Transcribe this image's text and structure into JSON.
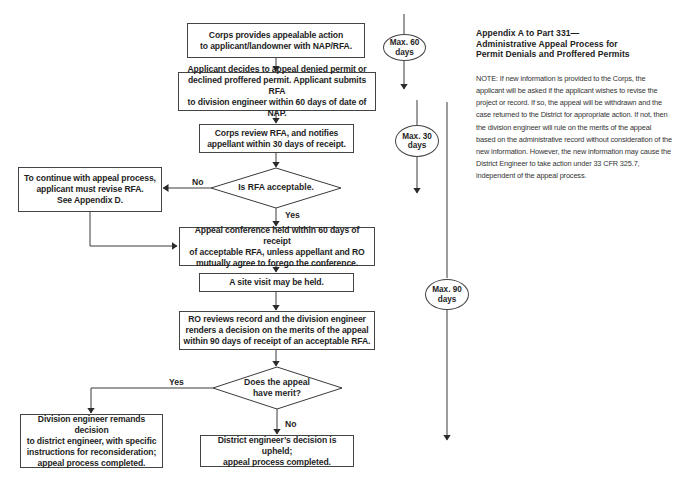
{
  "diagram": {
    "type": "flowchart",
    "title_lines": [
      "Appendix A to Part 331—",
      "Administrative Appeal Process for",
      "Permit Denials and Proffered Permits"
    ],
    "note": "NOTE: If new information is provided to the Corps, the applicant will be asked if the applicant wishes to revise the project or record. If so, the appeal will be withdrawn and the case returned to the District for appropriate action. If not, then the division engineer will rule on the merits of the appeal based on the administrative record without consideration of the new information. However, the new information may cause the District Engineer to take action under 33 CFR 325.7, independent of the appeal process.",
    "nodes": {
      "step1": "Corps provides appealable action\nto applicant/landowner with NAP/RFA.",
      "step2": "Applicant decides to appeal denied permit or\ndeclined proffered permit. Applicant submits RFA\nto division engineer within 60 days of date of NAP.",
      "step3": "Corps review RFA, and notifies\nappellant within 30 days of receipt.",
      "decision1": "Is RFA acceptable.",
      "revise": "To continue with appeal process,\napplicant must revise RFA.\nSee Appendix D.",
      "step4": "Appeal conference held within 60 days of receipt\nof acceptable RFA, unless appellant and RO\nmutually agree to forego the conference.",
      "step5": "A site visit may be held.",
      "step6": "RO reviews record and the division engineer\nrenders a decision on the merits of the appeal\nwithin 90 days of receipt of an acceptable RFA.",
      "decision2": "Does the appeal\nhave merit?",
      "remand": "Division engineer remands decision\nto district engineer, with specific\ninstructions for reconsideration;\nappeal process completed.",
      "upheld": "District engineer’s decision is upheld;\nappeal process completed."
    },
    "edge_labels": {
      "d1_no": "No",
      "d1_yes": "Yes",
      "d2_yes": "Yes",
      "d2_no": "No"
    },
    "timeline": [
      {
        "label": "Max. 60\ndays"
      },
      {
        "label": "Max. 30\ndays"
      },
      {
        "label": "Max. 90\ndays"
      }
    ],
    "colors": {
      "stroke": "#444444",
      "text": "#1e1e1e",
      "background": "#ffffff"
    }
  }
}
